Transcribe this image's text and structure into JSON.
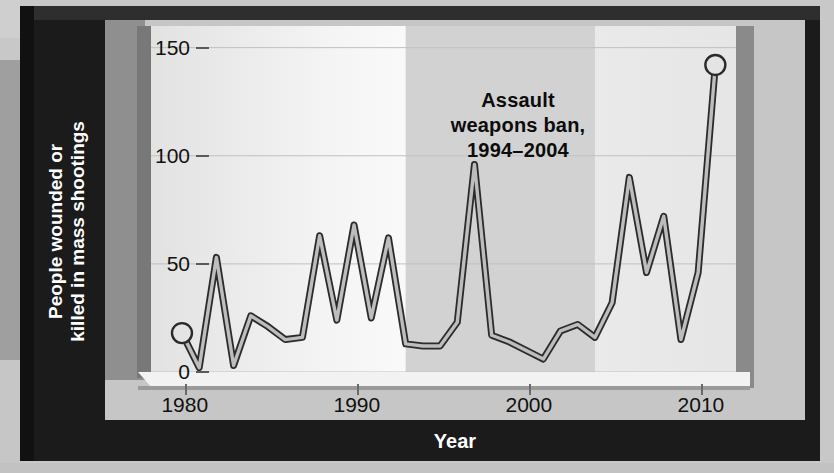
{
  "chart_data": {
    "type": "line",
    "title": "",
    "xlabel": "Year",
    "ylabel": "People wounded or killed in mass shootings",
    "ylabel_lines": [
      "People wounded or",
      "killed in mass shootings"
    ],
    "xlim": [
      1979.2,
      2013.2
    ],
    "ylim": [
      0,
      160
    ],
    "yticks": [
      0,
      50,
      100,
      150
    ],
    "ytick_labels": [
      "0",
      "50",
      "100",
      "150"
    ],
    "xticks": [
      1980,
      1990,
      2000,
      2010
    ],
    "xtick_labels": [
      "1980",
      "1990",
      "2000",
      "2010"
    ],
    "grid": true,
    "grid_axis": "y",
    "legend": false,
    "line_color": "#2b2b2b",
    "line_fill_color": "#bdbdbd",
    "marker_years": [
      1981,
      2012
    ],
    "series": [
      {
        "name": "People wounded or killed in mass shootings",
        "x": [
          1981,
          1982,
          1983,
          1984,
          1985,
          1986,
          1987,
          1988,
          1989,
          1990,
          1991,
          1992,
          1993,
          1994,
          1995,
          1996,
          1997,
          1998,
          1999,
          2000,
          2001,
          2002,
          2003,
          2004,
          2005,
          2006,
          2007,
          2008,
          2009,
          2010,
          2011,
          2012
        ],
        "y": [
          18,
          2,
          53,
          3,
          26,
          21,
          15,
          16,
          63,
          24,
          68,
          25,
          62,
          13,
          12,
          12,
          23,
          96,
          17,
          14,
          10,
          6,
          19,
          22,
          16,
          32,
          90,
          46,
          72,
          15,
          46,
          142
        ]
      }
    ],
    "annotations": [
      {
        "name": "assault-weapons-ban",
        "text_lines": [
          "Assault",
          "weapons ban,",
          "1994–2004"
        ],
        "span_start": 1994,
        "span_end": 2005,
        "shade_color": "#d2d2d2"
      }
    ],
    "colors": {
      "frame": "#1b1b1b",
      "panel": "#c6c6c6",
      "plot_background": "#f2f2f2",
      "shaded_band": "#d2d2d2",
      "axis_text": "#111111",
      "axis_title_text": "#ffffff",
      "gridline": "#c0c0c0"
    }
  },
  "axis": {
    "y_title_line1": "People wounded or",
    "y_title_line2": "killed in mass shootings",
    "x_title": "Year"
  },
  "annotation": {
    "line1": "Assault",
    "line2": "weapons ban,",
    "line3": "1994–2004"
  },
  "ytick_labels": [
    "150",
    "100",
    "50",
    "0"
  ],
  "xtick_labels": [
    "1980",
    "1990",
    "2000",
    "2010"
  ]
}
